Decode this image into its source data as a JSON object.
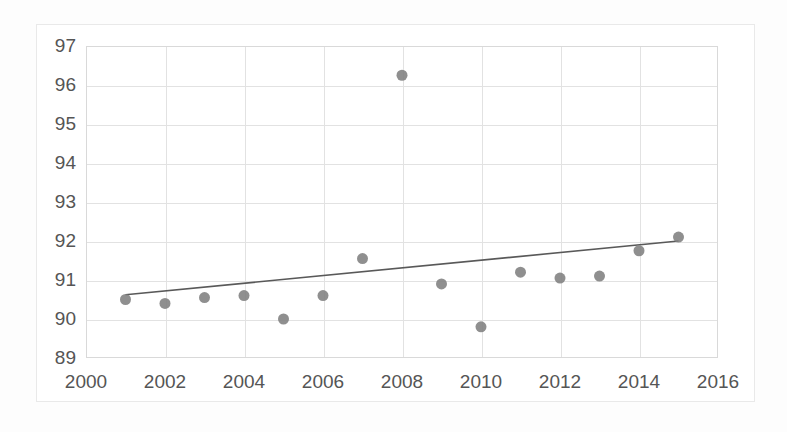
{
  "chart_data": {
    "type": "scatter",
    "title": "",
    "subtitle": "",
    "xlabel": "",
    "ylabel": "",
    "xlim": [
      2000,
      2016
    ],
    "ylim": [
      89,
      97
    ],
    "xticks": [
      2000,
      2002,
      2004,
      2006,
      2008,
      2010,
      2012,
      2014,
      2016
    ],
    "xtick_labels": [
      "2000",
      "2002",
      "2004",
      "2006",
      "2008",
      "2010",
      "2012",
      "2014",
      "2016"
    ],
    "yticks": [
      89,
      90,
      91,
      92,
      93,
      94,
      95,
      96,
      97
    ],
    "ytick_labels": [
      "89",
      "90",
      "91",
      "92",
      "93",
      "94",
      "95",
      "96",
      "97"
    ],
    "grid": true,
    "grid_axis": "both",
    "legend": false,
    "legend_position": "none",
    "x": [
      2001,
      2002,
      2003,
      2004,
      2005,
      2006,
      2007,
      2008,
      2009,
      2010,
      2011,
      2012,
      2013,
      2014,
      2015
    ],
    "series": [
      {
        "name": "observations",
        "marker": "circle",
        "marker_color": "#808080",
        "marker_size": 11,
        "values": [
          90.5,
          90.4,
          90.55,
          90.6,
          90.0,
          90.6,
          91.55,
          96.25,
          90.9,
          89.8,
          91.2,
          91.05,
          91.1,
          91.75,
          92.1
        ]
      }
    ],
    "trendline": {
      "name": "linear-trend",
      "color": "#595959",
      "x": [
        2001,
        2015
      ],
      "y": [
        90.62,
        92.0
      ]
    },
    "annotations": [],
    "colors": {
      "marker": "#808080",
      "trendline": "#595959",
      "gridline": "#e2e2e2",
      "plot_border": "#d9d9d9",
      "chart_frame": "#e9e9e9",
      "tick_label": "#555555",
      "background": "#ffffff"
    }
  }
}
